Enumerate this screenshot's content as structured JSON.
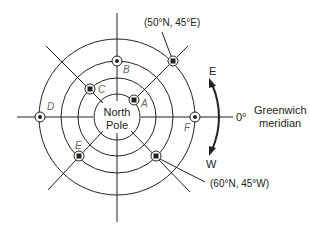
{
  "diagram": {
    "center_label_line1": "North",
    "center_label_line2": "Pole",
    "points": [
      {
        "id": "A",
        "label": "A"
      },
      {
        "id": "B",
        "label": "B"
      },
      {
        "id": "C",
        "label": "C"
      },
      {
        "id": "D",
        "label": "D"
      },
      {
        "id": "E",
        "label": "E"
      },
      {
        "id": "F",
        "label": "F"
      }
    ],
    "callouts": {
      "top_right": "(50°N, 45°E)",
      "bottom_right": "(60°N, 45°W)"
    },
    "direction_arrow": {
      "top": "E",
      "bottom": "W"
    },
    "meridian": {
      "degree": "0°",
      "line1": "Greenwich",
      "line2": "meridian"
    },
    "colors": {
      "line": "#222222",
      "label": "#666666"
    }
  }
}
